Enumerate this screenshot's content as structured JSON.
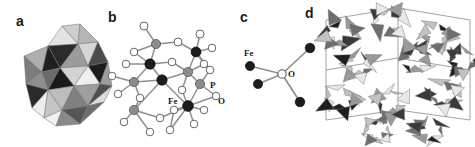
{
  "figure": {
    "background": "#ffffff",
    "width": 475,
    "height": 147,
    "panels": [
      {
        "id": "a",
        "letter": "a",
        "letter_x": 16,
        "letter_y": 14,
        "caption": "polyhedral-cluster",
        "type": "polyhedral-cluster",
        "x": 18,
        "y": 22,
        "w": 88,
        "h": 104
      },
      {
        "id": "b",
        "letter": "b",
        "letter_x": 108,
        "letter_y": 10,
        "caption": "ball-and-stick-cluster",
        "type": "ball-and-stick",
        "x": 104,
        "y": 12,
        "w": 122,
        "h": 130
      },
      {
        "id": "c",
        "letter": "c",
        "letter_x": 240,
        "letter_y": 10,
        "caption": "oxygen-centered-fe4-coordination",
        "type": "coordination",
        "x": 236,
        "y": 30,
        "w": 84,
        "h": 80
      },
      {
        "id": "d",
        "letter": "d",
        "letter_x": 305,
        "letter_y": 6,
        "caption": "extended-polyhedral-framework",
        "type": "polyhedral-framework",
        "x": 318,
        "y": 2,
        "w": 157,
        "h": 145
      }
    ]
  },
  "labels": {
    "fe": "Fe",
    "p": "P",
    "o": "O"
  },
  "panel_b_labels": [
    {
      "text": "Fe",
      "x": 64,
      "y": 92
    },
    {
      "text": "P",
      "x": 106,
      "y": 76
    },
    {
      "text": "O",
      "x": 114,
      "y": 92
    }
  ],
  "panel_c_labels": [
    {
      "text": "Fe",
      "x": 8,
      "y": 26
    },
    {
      "text": "O",
      "x": 52,
      "y": 47
    }
  ],
  "colors": {
    "background": "#ffffff",
    "atom_fe": "#1c1c1c",
    "atom_p": "#8c8c8c",
    "atom_o": "#ffffff",
    "atom_outline": "#555555",
    "bond": "#909090",
    "label_text": "#1a1a1a",
    "poly_light": "#e8e8e8",
    "poly_midlight": "#c2c2c2",
    "poly_mid": "#9a9a9a",
    "poly_middark": "#6e6e6e",
    "poly_dark": "#3a3a3a",
    "poly_darkest": "#1e1e1e",
    "poly_edge": "#707070",
    "cell_edge": "#8a8a8a"
  },
  "panel_a": {
    "faces": [
      {
        "pts": "44,4 60,22 30,24",
        "fill": "#e4e4e4"
      },
      {
        "pts": "44,4 60,22 62,2",
        "fill": "#cdcdcd"
      },
      {
        "pts": "30,24 60,22 42,46",
        "fill": "#2b2b2b"
      },
      {
        "pts": "60,22 62,2 80,20",
        "fill": "#b4b4b4"
      },
      {
        "pts": "60,22 80,20 70,44",
        "fill": "#d6d6d6"
      },
      {
        "pts": "60,22 70,44 42,46",
        "fill": "#9b9b9b"
      },
      {
        "pts": "6,34 30,24 24,50",
        "fill": "#aeaeae"
      },
      {
        "pts": "30,24 42,46 24,50",
        "fill": "#1f1f1f"
      },
      {
        "pts": "6,34 24,50 8,62",
        "fill": "#7c7c7c"
      },
      {
        "pts": "24,50 42,46 30,68",
        "fill": "#6a6a6a"
      },
      {
        "pts": "8,62 24,50 30,68",
        "fill": "#8e8e8e"
      },
      {
        "pts": "70,44 80,20 90,40",
        "fill": "#4c4c4c"
      },
      {
        "pts": "70,44 90,40 82,62",
        "fill": "#1d1d1d"
      },
      {
        "pts": "42,46 70,44 56,64",
        "fill": "#d2d2d2"
      },
      {
        "pts": "56,64 70,44 82,62",
        "fill": "#efefef"
      },
      {
        "pts": "42,46 56,64 30,68",
        "fill": "#1a1a1a"
      },
      {
        "pts": "30,68 56,64 44,88",
        "fill": "#bdbdbd"
      },
      {
        "pts": "56,64 82,62 70,84",
        "fill": "#9e9e9e"
      },
      {
        "pts": "56,64 70,84 44,88",
        "fill": "#808080"
      },
      {
        "pts": "8,62 30,68 14,86",
        "fill": "#2a2a2a"
      },
      {
        "pts": "14,86 30,68 26,96",
        "fill": "#ededed"
      },
      {
        "pts": "26,96 30,68 44,88",
        "fill": "#c6c6c6"
      },
      {
        "pts": "44,88 70,84 62,102",
        "fill": "#565656"
      },
      {
        "pts": "26,96 44,88 38,104",
        "fill": "#f2f2f2"
      },
      {
        "pts": "38,104 44,88 62,102",
        "fill": "#8a8a8a"
      },
      {
        "pts": "82,62 90,40 94,64",
        "fill": "#9d9d9d"
      },
      {
        "pts": "70,84 82,62 94,64",
        "fill": "#4f4f4f"
      },
      {
        "pts": "70,84 94,64 86,80",
        "fill": "#dcdcdc"
      },
      {
        "pts": "62,102 70,84 86,80",
        "fill": "#6d6d6d"
      }
    ]
  },
  "panel_b": {
    "atoms": [
      {
        "x": 40,
        "y": 14,
        "r": 4.0,
        "kind": "o"
      },
      {
        "x": 52,
        "y": 32,
        "r": 4.6,
        "kind": "p"
      },
      {
        "x": 30,
        "y": 40,
        "r": 3.8,
        "kind": "o"
      },
      {
        "x": 74,
        "y": 30,
        "r": 4.0,
        "kind": "o"
      },
      {
        "x": 96,
        "y": 22,
        "r": 4.0,
        "kind": "o"
      },
      {
        "x": 92,
        "y": 40,
        "r": 5.0,
        "kind": "fe"
      },
      {
        "x": 108,
        "y": 36,
        "r": 3.8,
        "kind": "o"
      },
      {
        "x": 100,
        "y": 52,
        "r": 3.8,
        "kind": "o"
      },
      {
        "x": 46,
        "y": 52,
        "r": 5.2,
        "kind": "fe"
      },
      {
        "x": 22,
        "y": 52,
        "r": 3.8,
        "kind": "o"
      },
      {
        "x": 68,
        "y": 50,
        "r": 3.8,
        "kind": "o"
      },
      {
        "x": 58,
        "y": 68,
        "r": 5.2,
        "kind": "fe"
      },
      {
        "x": 84,
        "y": 60,
        "r": 4.6,
        "kind": "p"
      },
      {
        "x": 30,
        "y": 70,
        "r": 4.6,
        "kind": "p"
      },
      {
        "x": 8,
        "y": 64,
        "r": 3.8,
        "kind": "o"
      },
      {
        "x": 14,
        "y": 82,
        "r": 3.8,
        "kind": "o"
      },
      {
        "x": 36,
        "y": 86,
        "r": 3.8,
        "kind": "o"
      },
      {
        "x": 78,
        "y": 78,
        "r": 3.8,
        "kind": "o"
      },
      {
        "x": 96,
        "y": 72,
        "r": 4.6,
        "kind": "p"
      },
      {
        "x": 112,
        "y": 84,
        "r": 3.8,
        "kind": "o"
      },
      {
        "x": 84,
        "y": 94,
        "r": 5.4,
        "kind": "fe"
      },
      {
        "x": 70,
        "y": 98,
        "r": 3.8,
        "kind": "o"
      },
      {
        "x": 100,
        "y": 98,
        "r": 3.8,
        "kind": "o"
      },
      {
        "x": 90,
        "y": 112,
        "r": 3.8,
        "kind": "o"
      },
      {
        "x": 30,
        "y": 98,
        "r": 4.6,
        "kind": "p"
      },
      {
        "x": 20,
        "y": 110,
        "r": 3.8,
        "kind": "o"
      },
      {
        "x": 56,
        "y": 106,
        "r": 3.8,
        "kind": "o"
      },
      {
        "x": 46,
        "y": 120,
        "r": 3.8,
        "kind": "o"
      },
      {
        "x": 66,
        "y": 118,
        "r": 3.8,
        "kind": "o"
      },
      {
        "x": 106,
        "y": 58,
        "r": 3.8,
        "kind": "o"
      }
    ],
    "bonds": [
      [
        0,
        1
      ],
      [
        1,
        2
      ],
      [
        1,
        8
      ],
      [
        1,
        3
      ],
      [
        3,
        5
      ],
      [
        4,
        5
      ],
      [
        5,
        6
      ],
      [
        5,
        7
      ],
      [
        5,
        12
      ],
      [
        2,
        8
      ],
      [
        8,
        9
      ],
      [
        8,
        10
      ],
      [
        8,
        11
      ],
      [
        10,
        12
      ],
      [
        11,
        12
      ],
      [
        12,
        17
      ],
      [
        12,
        18
      ],
      [
        8,
        13
      ],
      [
        13,
        14
      ],
      [
        13,
        15
      ],
      [
        13,
        16
      ],
      [
        13,
        11
      ],
      [
        11,
        20
      ],
      [
        20,
        17
      ],
      [
        20,
        19
      ],
      [
        20,
        21
      ],
      [
        20,
        22
      ],
      [
        20,
        23
      ],
      [
        18,
        19
      ],
      [
        18,
        20
      ],
      [
        16,
        24
      ],
      [
        24,
        25
      ],
      [
        24,
        26
      ],
      [
        24,
        27
      ],
      [
        11,
        24
      ],
      [
        21,
        28
      ],
      [
        20,
        28
      ],
      [
        5,
        29
      ],
      [
        29,
        18
      ],
      [
        7,
        12
      ],
      [
        26,
        20
      ]
    ]
  },
  "panel_c": {
    "center": {
      "x": 46,
      "y": 44,
      "r": 4.2
    },
    "fe_atoms": [
      {
        "x": 14,
        "y": 36,
        "r": 4.6
      },
      {
        "x": 22,
        "y": 54,
        "r": 4.6
      },
      {
        "x": 74,
        "y": 18,
        "r": 4.8
      },
      {
        "x": 64,
        "y": 72,
        "r": 4.8
      }
    ]
  },
  "panel_d": {
    "cell_lines": [
      "8,18 8,118",
      "80,6 80,108",
      "152,18 152,118",
      "8,18 80,6",
      "80,6 152,18",
      "8,118 80,108",
      "80,108 152,118",
      "8,68 80,56",
      "80,56 152,68"
    ],
    "clusters": [
      {
        "cx": 22,
        "cy": 30,
        "s": 1.0
      },
      {
        "cx": 70,
        "cy": 20,
        "s": 1.05
      },
      {
        "cx": 118,
        "cy": 32,
        "s": 1.0
      },
      {
        "cx": 40,
        "cy": 62,
        "s": 0.95
      },
      {
        "cx": 96,
        "cy": 58,
        "s": 1.0
      },
      {
        "cx": 22,
        "cy": 96,
        "s": 1.0
      },
      {
        "cx": 74,
        "cy": 100,
        "s": 1.05
      },
      {
        "cx": 124,
        "cy": 92,
        "s": 1.0
      },
      {
        "cx": 146,
        "cy": 58,
        "s": 0.9
      },
      {
        "cx": 60,
        "cy": 128,
        "s": 0.85
      },
      {
        "cx": 112,
        "cy": 128,
        "s": 0.85
      }
    ]
  }
}
